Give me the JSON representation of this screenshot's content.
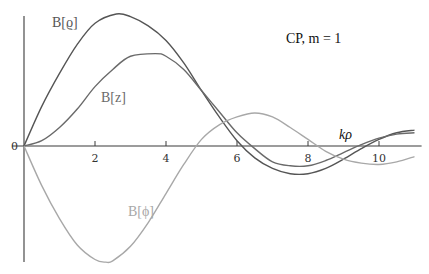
{
  "chart_data": {
    "type": "line",
    "title": "",
    "annotation": "CP, m = 1",
    "xlabel": "kρ",
    "ylabel": "",
    "xlim": [
      0,
      11.2
    ],
    "ylim": [
      -0.94,
      1.08
    ],
    "x_ticks": [
      2,
      4,
      6,
      8,
      10
    ],
    "x_tick_labels": [
      "2",
      "4",
      "6",
      "8",
      "10"
    ],
    "y_ticks": [
      0
    ],
    "y_tick_labels": [
      "0"
    ],
    "grid": false,
    "legend": "inline labels",
    "series": [
      {
        "name": "B[ϱ]",
        "label_text": "B[ϱ]",
        "color": "#555555",
        "x": [
          0,
          0.5,
          1,
          1.5,
          2,
          2.6,
          3,
          3.5,
          4,
          4.5,
          5,
          5.5,
          6,
          6.5,
          7,
          7.5,
          8,
          8.5,
          9,
          9.5,
          10,
          10.5,
          11
        ],
        "y": [
          0,
          0.3,
          0.55,
          0.77,
          0.93,
          1.0,
          0.98,
          0.91,
          0.8,
          0.63,
          0.42,
          0.22,
          0.04,
          -0.09,
          -0.17,
          -0.21,
          -0.21,
          -0.17,
          -0.1,
          -0.02,
          0.05,
          0.1,
          0.12
        ]
      },
      {
        "name": "B[z]",
        "label_text": "B[z]",
        "color": "#6a6a6a",
        "x": [
          0,
          0.5,
          1,
          1.5,
          2,
          2.5,
          3,
          3.7,
          4,
          4.5,
          5,
          5.5,
          6,
          6.5,
          7,
          7.5,
          8,
          8.5,
          9,
          9.5,
          10,
          10.5,
          11
        ],
        "y": [
          0,
          0.04,
          0.14,
          0.28,
          0.45,
          0.58,
          0.68,
          0.7,
          0.68,
          0.58,
          0.42,
          0.26,
          0.1,
          -0.02,
          -0.12,
          -0.15,
          -0.15,
          -0.11,
          -0.05,
          0.01,
          0.06,
          0.09,
          0.1
        ]
      },
      {
        "name": "B[φ]",
        "label_text": "B[ϕ]",
        "color": "#a8a8a8",
        "x": [
          0,
          0.5,
          1,
          1.5,
          2,
          2.3,
          2.5,
          3,
          3.5,
          4,
          4.5,
          5,
          5.5,
          6,
          6.5,
          7,
          7.5,
          8,
          8.5,
          9,
          9.5,
          10,
          10.5,
          11
        ],
        "y": [
          0,
          -0.3,
          -0.55,
          -0.75,
          -0.86,
          -0.88,
          -0.87,
          -0.76,
          -0.58,
          -0.36,
          -0.14,
          0.05,
          0.16,
          0.22,
          0.25,
          0.22,
          0.14,
          0.05,
          -0.04,
          -0.1,
          -0.13,
          -0.14,
          -0.12,
          -0.08
        ]
      }
    ]
  }
}
